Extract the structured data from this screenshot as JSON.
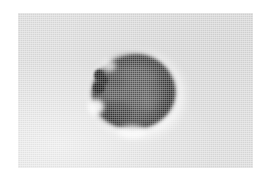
{
  "figure": {
    "kind": "grayscale-micrograph",
    "canvas": {
      "width": 272,
      "height": 183,
      "page_background_color": "#ffffff"
    },
    "panel": {
      "name": "image-panel",
      "x": 18,
      "y": 13,
      "width": 235,
      "height": 155,
      "background_color": "#dcdcdc"
    },
    "specimen": {
      "name": "specimen",
      "center_x": 131,
      "center_y": 91,
      "width": 83,
      "height": 74,
      "fill_color": "#585858",
      "rim_color": "#3a3a3a",
      "dark_granule_color": "#1c1c1c",
      "halo_color": "#ffffff"
    },
    "palette": {
      "page": "#ffffff",
      "background": "#dcdcdc",
      "specimen_interior": "#585858",
      "specimen_rim": "#3a3a3a",
      "darkest_granule": "#181818",
      "halo_highlight": "#ffffff"
    },
    "labels": {
      "title": "",
      "caption": "",
      "scale_bar": "",
      "annotations": []
    }
  }
}
